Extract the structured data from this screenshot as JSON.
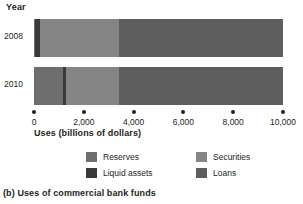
{
  "axis_label_y": "Year",
  "axis_title_x": "Uses (billions of dollars)",
  "caption": "(b) Uses of commercial bank funds",
  "legend": [
    {
      "label": "Reserves",
      "color": "#6e6e6e",
      "key": "reserves"
    },
    {
      "label": "Liquid assets",
      "color": "#3a3a3a",
      "key": "liquid-assets"
    },
    {
      "label": "Securities",
      "color": "#858585",
      "key": "securities"
    },
    {
      "label": "Loans",
      "color": "#5e5e5e",
      "key": "loans"
    }
  ],
  "chart_data": {
    "type": "bar",
    "orientation": "horizontal",
    "stacked": true,
    "title": "(b) Uses of commercial bank funds",
    "xlabel": "Uses (billions of dollars)",
    "ylabel": "Year",
    "xlim": [
      0,
      10000
    ],
    "ticks": [
      0,
      2000,
      4000,
      6000,
      8000,
      10000
    ],
    "tick_labels": [
      "0",
      "2,000",
      "4,000",
      "6,000",
      "8,000",
      "10,000"
    ],
    "grid": false,
    "legend_position": "bottom",
    "categories": [
      "2008",
      "2010"
    ],
    "series": [
      {
        "name": "Reserves",
        "color": "#6e6e6e",
        "values": [
          40,
          1150
        ]
      },
      {
        "name": "Liquid assets",
        "color": "#3a3a3a",
        "values": [
          200,
          130
        ]
      },
      {
        "name": "Securities",
        "color": "#858585",
        "values": [
          3170,
          2140
        ]
      },
      {
        "name": "Loans",
        "color": "#5e5e5e",
        "values": [
          6590,
          6580
        ]
      }
    ],
    "totals": [
      10000,
      10000
    ]
  }
}
